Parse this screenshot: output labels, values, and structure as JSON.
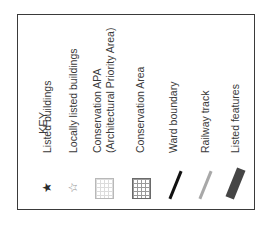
{
  "key": {
    "title": "KEY",
    "orientation": "rotated -90deg (text reads bottom-to-top)",
    "items": [
      {
        "label": "Listed buildings",
        "symbol": "star-filled-icon",
        "glyph": "★",
        "color": "#2a2a2a"
      },
      {
        "label": "Locally listed buildings",
        "symbol": "star-outline-icon",
        "glyph": "☆",
        "color": "#8a8a8a"
      },
      {
        "label": "Conservation APA",
        "label_line2": "(Architectural Priority Area)",
        "symbol": "light-grid-icon",
        "color": "#b8b8b8"
      },
      {
        "label": "Conservation Area",
        "symbol": "dark-grid-icon",
        "color": "#6a6a6a"
      },
      {
        "label": "Ward boundary",
        "symbol": "black-line-icon",
        "color": "#111111"
      },
      {
        "label": "Railway track",
        "symbol": "gray-line-icon",
        "color": "#a0a0a0"
      },
      {
        "label": "Listed features",
        "symbol": "thick-dark-band-icon",
        "color": "#444444"
      }
    ]
  }
}
